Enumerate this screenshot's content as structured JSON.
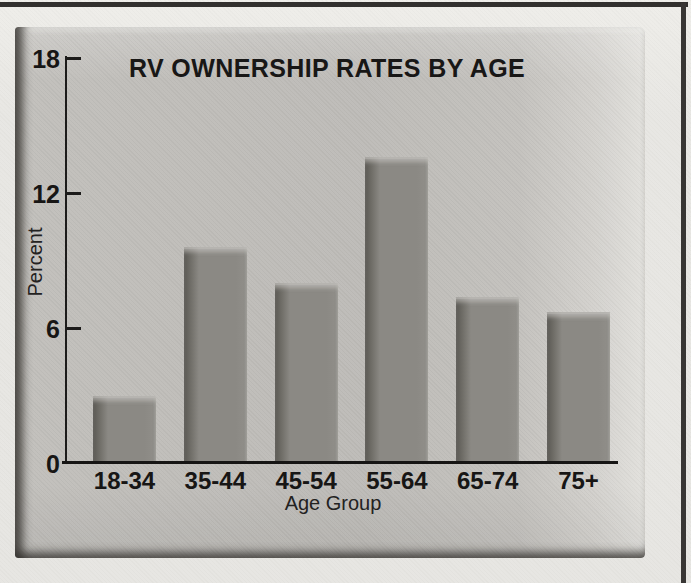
{
  "figure": {
    "kind": "scanned textbook bar chart photo",
    "frame_border_color": "#32302e",
    "page_background": "#e7e6e2",
    "panel_background": "#bfbdb9",
    "bar_color": "#8b8984",
    "axis_color": "#1c1b1a",
    "text_color": "#171615"
  },
  "chart_data": {
    "type": "bar",
    "title": "RV OWNERSHIP RATES BY AGE",
    "xlabel": "Age Group",
    "ylabel": "Percent",
    "categories": [
      "18-34",
      "35-44",
      "45-54",
      "55-64",
      "65-74",
      "75+"
    ],
    "values": [
      3.0,
      9.6,
      8.0,
      13.6,
      7.4,
      6.7
    ],
    "ylim": [
      0,
      18
    ],
    "yticks": [
      0,
      6,
      12,
      18
    ],
    "grid": false,
    "legend_position": "none"
  }
}
